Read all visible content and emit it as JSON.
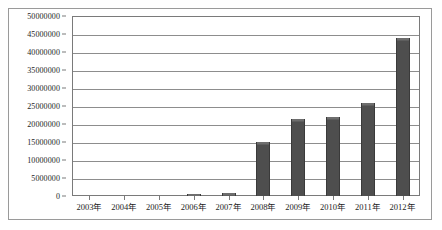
{
  "chart_data": {
    "type": "bar",
    "title": "",
    "subtitle": "",
    "xlabel": "",
    "ylabel": "",
    "categories": [
      "2003年",
      "2004年",
      "2005年",
      "2006年",
      "2007年",
      "2008年",
      "2009年",
      "2010年",
      "2011年",
      "2012年"
    ],
    "values": [
      0,
      0,
      0,
      600000,
      700000,
      15000000,
      21500000,
      22000000,
      25800000,
      44000000
    ],
    "series": [
      {
        "name": "",
        "values": [
          0,
          0,
          0,
          600000,
          700000,
          15000000,
          21500000,
          22000000,
          25800000,
          44000000
        ]
      }
    ],
    "ylim": [
      0,
      50000000
    ],
    "ytick_values": [
      0,
      5000000,
      10000000,
      15000000,
      20000000,
      25000000,
      30000000,
      35000000,
      40000000,
      45000000,
      50000000
    ],
    "ytick_labels": [
      "0",
      "5000000",
      "10000000",
      "15000000",
      "20000000",
      "25000000",
      "30000000",
      "35000000",
      "40000000",
      "45000000",
      "50000000"
    ],
    "grid": true,
    "grid_axis": "y",
    "legend": false,
    "legend_position": "none",
    "bar_color": "#4e4e4e",
    "grid_color": "#8d8d8d",
    "axis_color": "#7a7a7a",
    "background_color": "#ffffff",
    "text_color": "#1d1d1d"
  }
}
